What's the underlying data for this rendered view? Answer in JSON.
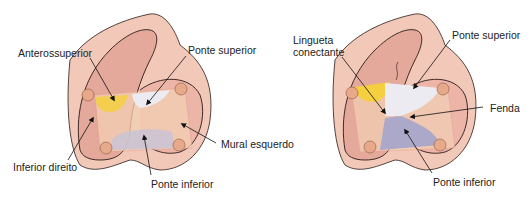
{
  "diagrams": [
    {
      "id": "left",
      "labels": {
        "anterosuperior": "Anterossuperior",
        "ponte_superior": "Ponte superior",
        "mural_esquerdo": "Mural esquerdo",
        "inferior_direito": "Inferior direito",
        "ponte_inferior": "Ponte inferior"
      }
    },
    {
      "id": "right",
      "labels": {
        "lingueta_1": "Lingueta",
        "lingueta_2": "conectante",
        "ponte_superior": "Ponte superior",
        "fenda": "Fenda",
        "ponte_inferior": "Ponte inferior"
      }
    }
  ],
  "colors": {
    "outer_tissue": "#f2c9b9",
    "inner_tissue": "#ecb5a8",
    "ventricle": "#e0a596",
    "annulus": "#f3d0b4",
    "papillary": "#e8a98a",
    "yellow": "#f4cf3e",
    "white_leaflet": "#ecebf2",
    "purple_leaflet": "#aba8c9",
    "outline": "#2a1a18"
  }
}
